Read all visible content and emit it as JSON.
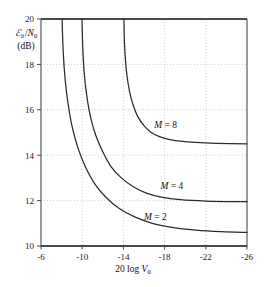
{
  "chart_data": {
    "type": "line",
    "title": "",
    "xlabel": "20 log V0",
    "ylabel": "Eb /N0 (dB)",
    "xlim": [
      -6,
      -26
    ],
    "ylim": [
      10,
      20
    ],
    "x_ticks": [
      "-6",
      "-10",
      "-14",
      "-18",
      "-22",
      "-26"
    ],
    "x_tick_values": [
      -6,
      -10,
      -14,
      -18,
      -22,
      -26
    ],
    "y_ticks": [
      "20",
      "18",
      "16",
      "14",
      "12",
      "10"
    ],
    "y_tick_values": [
      20,
      18,
      16,
      14,
      12,
      10
    ],
    "grid": true,
    "grid_style": "dotted",
    "x_axis_direction": "decreasing",
    "legend_position": "inline-annotations",
    "series": [
      {
        "name": "M = 8",
        "label": "M = 8",
        "asymptote_y": 14.5,
        "asymptote_x": -14.0,
        "points": [
          [
            -14.05,
            20.0
          ],
          [
            -14.1,
            19.0
          ],
          [
            -14.2,
            18.2
          ],
          [
            -14.35,
            17.5
          ],
          [
            -14.6,
            16.8
          ],
          [
            -14.95,
            16.2
          ],
          [
            -15.4,
            15.7
          ],
          [
            -16.0,
            15.3
          ],
          [
            -16.7,
            15.0
          ],
          [
            -17.5,
            14.82
          ],
          [
            -18.4,
            14.7
          ],
          [
            -19.5,
            14.62
          ],
          [
            -21.0,
            14.56
          ],
          [
            -23.0,
            14.52
          ],
          [
            -26.0,
            14.5
          ]
        ]
      },
      {
        "name": "M = 4",
        "label": "M = 4",
        "asymptote_y": 11.95,
        "asymptote_x": -9.95,
        "points": [
          [
            -9.98,
            20.0
          ],
          [
            -10.05,
            18.8
          ],
          [
            -10.2,
            17.6
          ],
          [
            -10.45,
            16.6
          ],
          [
            -10.8,
            15.7
          ],
          [
            -11.3,
            14.9
          ],
          [
            -11.95,
            14.2
          ],
          [
            -12.8,
            13.5
          ],
          [
            -13.8,
            13.0
          ],
          [
            -15.0,
            12.6
          ],
          [
            -16.3,
            12.32
          ],
          [
            -17.8,
            12.14
          ],
          [
            -19.5,
            12.04
          ],
          [
            -22.0,
            11.98
          ],
          [
            -26.0,
            11.95
          ]
        ]
      },
      {
        "name": "M = 2",
        "label": "M = 2",
        "asymptote_y": 10.6,
        "asymptote_x": -8.0,
        "points": [
          [
            -8.05,
            20.0
          ],
          [
            -8.15,
            18.6
          ],
          [
            -8.35,
            17.3
          ],
          [
            -8.65,
            16.2
          ],
          [
            -9.05,
            15.2
          ],
          [
            -9.6,
            14.3
          ],
          [
            -10.3,
            13.5
          ],
          [
            -11.2,
            12.75
          ],
          [
            -12.3,
            12.15
          ],
          [
            -13.6,
            11.65
          ],
          [
            -15.1,
            11.28
          ],
          [
            -16.8,
            11.0
          ],
          [
            -18.7,
            10.82
          ],
          [
            -21.0,
            10.7
          ],
          [
            -23.5,
            10.63
          ],
          [
            -26.0,
            10.6
          ]
        ]
      }
    ],
    "axis_label_parts": {
      "y_line1_script": "E",
      "y_line1_sub1": "b",
      "y_line1_slash": " /",
      "y_line1_n": "N",
      "y_line1_sub2": "0",
      "y_line2": "(dB)",
      "x_prefix": "20 log ",
      "x_var": "V",
      "x_sub": "0"
    },
    "annotations": [
      {
        "text_m": "M",
        "text_eq": " = ",
        "text_val": "8",
        "x": -17.0,
        "y": 15.3
      },
      {
        "text_m": "M",
        "text_eq": " = ",
        "text_val": "4",
        "x": -17.6,
        "y": 12.6
      },
      {
        "text_m": "M",
        "text_eq": " = ",
        "text_val": "2",
        "x": -16.0,
        "y": 11.25
      }
    ]
  },
  "colors": {
    "frame": "#4a4a4a",
    "curve": "#2b2b2b",
    "grid": "#b9b9b9",
    "text": "#111111",
    "background": "#ffffff"
  }
}
